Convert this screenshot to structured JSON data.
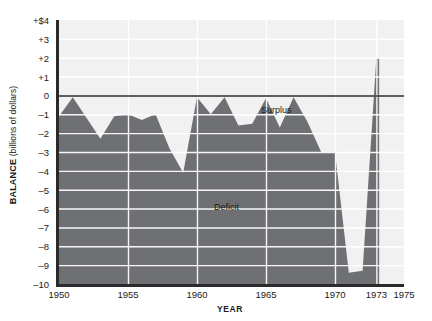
{
  "chart_data": {
    "type": "area",
    "title": "",
    "subtitle": "",
    "xlabel": "YEAR",
    "ylabel_bold": "BALANCE",
    "ylabel_rest": " (billions of dollars)",
    "xlim": [
      1950,
      1975
    ],
    "ylim": [
      -10,
      4
    ],
    "grid": true,
    "legend": "none",
    "zero_line": 0,
    "x_ticks": [
      {
        "value": 1950,
        "label": "1950"
      },
      {
        "value": 1955,
        "label": "1955"
      },
      {
        "value": 1960,
        "label": "1960"
      },
      {
        "value": 1965,
        "label": "1965"
      },
      {
        "value": 1970,
        "label": "1970"
      },
      {
        "value": 1973,
        "label": "1973"
      },
      {
        "value": 1975,
        "label": "1975"
      }
    ],
    "y_ticks": [
      {
        "value": 4,
        "label": "+$4"
      },
      {
        "value": 3,
        "label": "+3"
      },
      {
        "value": 2,
        "label": "+2"
      },
      {
        "value": 1,
        "label": "+1"
      },
      {
        "value": 0,
        "label": "0"
      },
      {
        "value": -1,
        "label": "–1"
      },
      {
        "value": -2,
        "label": "–2"
      },
      {
        "value": -3,
        "label": "–3"
      },
      {
        "value": -4,
        "label": "–4"
      },
      {
        "value": -5,
        "label": "–5"
      },
      {
        "value": -6,
        "label": "–6"
      },
      {
        "value": -7,
        "label": "–7"
      },
      {
        "value": -8,
        "label": "–8"
      },
      {
        "value": -9,
        "label": "–9"
      },
      {
        "value": -10,
        "label": "–10"
      }
    ],
    "annotations": [
      {
        "name": "surplus-label",
        "text": "Surplus",
        "x": 1965.5,
        "y": 0.55
      },
      {
        "name": "deficit-label",
        "text": "Deficit",
        "x": 1958.0,
        "y": -5.1
      }
    ],
    "series": [
      {
        "name": "Federal budget balance",
        "x": [
          1950,
          1951,
          1952,
          1953,
          1954,
          1955,
          1956,
          1957,
          1958,
          1959,
          1960,
          1961,
          1962,
          1963,
          1964,
          1965,
          1966,
          1967,
          1968,
          1969,
          1970,
          1971,
          1972,
          1973,
          1973.2
        ],
        "values": [
          -1.1,
          -0.1,
          -1.2,
          -2.3,
          -1.1,
          -1.0,
          -1.3,
          -1.0,
          -2.8,
          -4.1,
          -0.1,
          -1.0,
          -0.1,
          -1.6,
          -1.5,
          -0.15,
          -1.7,
          -0.1,
          -1.4,
          -3.0,
          -3.0,
          -9.4,
          -9.3,
          2.0,
          2.0
        ],
        "fill_to": -10,
        "color": "#6e7073"
      }
    ]
  },
  "colors": {
    "fill": "#6e7073",
    "plot_background": "#f1f1f1",
    "gridline": "#ffffff",
    "axis": "#2a2a2a",
    "text": "#1a1a1a",
    "page_background": "#ffffff"
  }
}
